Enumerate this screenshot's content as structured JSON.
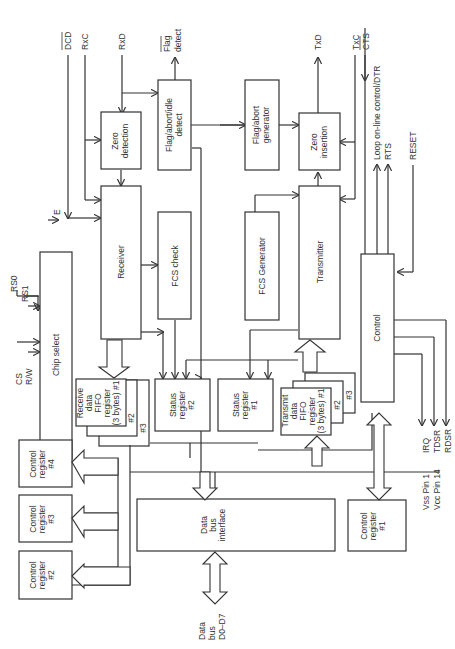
{
  "diagram": {
    "title": "",
    "colors": {
      "line": "#333333",
      "background": "#ffffff"
    },
    "blocks": {
      "zero_detection": [
        "Zero",
        "detection"
      ],
      "flag_abort_idle_detect": [
        "Flag/abort/idle",
        "detect"
      ],
      "flag_abort_generator": [
        "Flag/abort",
        "generator"
      ],
      "zero_insertion": [
        "Zero",
        "insertion"
      ],
      "receiver": "Receiver",
      "fcs_check": "FCS check",
      "fcs_generator": "FCS Generator",
      "transmitter": "Transmitter",
      "chip_select": "Chip select",
      "control": "Control",
      "receive_fifo": [
        "Receive",
        "data",
        "FIFO",
        "register",
        "(3 bytes) #1"
      ],
      "receive_fifo_2": "#2",
      "receive_fifo_3": "#3",
      "status_register_2": [
        "Status",
        "register",
        "#2"
      ],
      "status_register_1": [
        "Status",
        "register",
        "#1"
      ],
      "transmit_fifo": [
        "Transmit",
        "data",
        "FIFO",
        "register",
        "(3 bytes) #1"
      ],
      "transmit_fifo_2": "#2",
      "transmit_fifo_3": "#3",
      "control_register_4": [
        "Control",
        "register",
        "#4"
      ],
      "control_register_3": [
        "Control",
        "register",
        "#3"
      ],
      "control_register_2": [
        "Control",
        "register",
        "#2"
      ],
      "control_register_1": [
        "Control",
        "register",
        "#1"
      ],
      "data_bus_interface": [
        "Data",
        "bus",
        "interface"
      ]
    },
    "signals": {
      "dcd": "DCD",
      "rxc": "RxC",
      "rxd": "RxD",
      "flag_detect": [
        "Flag",
        "detect"
      ],
      "txd": "TxD",
      "txc": "TxC",
      "cts": "CTS",
      "loop_dtr": "Loop on-line control/DTR",
      "rts": "RTS",
      "reset": "RESET",
      "e": "E",
      "rs0": "RS0",
      "rs1": "RS1",
      "cs": "CS",
      "rw": "R/W",
      "irq": "IRQ",
      "tdsr": "TDSR",
      "rdsr": "RDSR",
      "vss": "Vss Pin 1",
      "vcc": "Vcc Pin 14",
      "data_bus": [
        "Data",
        "bus",
        "D0–D7"
      ]
    }
  }
}
